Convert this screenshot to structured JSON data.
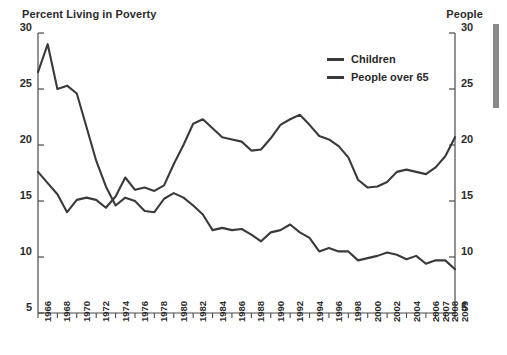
{
  "header": {
    "left_title": "Percent Living in Poverty",
    "right_title": "People"
  },
  "legend": {
    "position": "top-center",
    "items": [
      {
        "label": "Children",
        "color": "#3a3a3a"
      },
      {
        "label": "People over 65",
        "color": "#3a3a3a"
      }
    ]
  },
  "axes": {
    "y_left_ticks": [
      "30",
      "25",
      "20",
      "15",
      "10",
      "5"
    ],
    "y_right_ticks": [
      "30",
      "25",
      "20",
      "15",
      "10",
      "5"
    ],
    "x_ticks": [
      "1966",
      "1968",
      "1970",
      "1972",
      "1974",
      "1976",
      "1978",
      "1980",
      "1982",
      "1984",
      "1986",
      "1988",
      "1990",
      "1992",
      "1994",
      "1996",
      "1998",
      "2000",
      "2002",
      "2004",
      "2006",
      "2007",
      "2008",
      "2009"
    ]
  },
  "chart_data": {
    "type": "line",
    "title": "Percent Living in Poverty",
    "ylabel": "Percent Living in Poverty",
    "ylabel_right": "People",
    "xlabel": "",
    "ylim": [
      5,
      30
    ],
    "grid": false,
    "legend_position": "top-center",
    "x": [
      1966,
      1967,
      1968,
      1969,
      1970,
      1971,
      1972,
      1973,
      1974,
      1975,
      1976,
      1977,
      1978,
      1979,
      1980,
      1981,
      1982,
      1983,
      1984,
      1985,
      1986,
      1987,
      1988,
      1989,
      1990,
      1991,
      1992,
      1993,
      1994,
      1995,
      1996,
      1997,
      1998,
      1999,
      2000,
      2001,
      2002,
      2003,
      2004,
      2005,
      2006,
      2007,
      2008,
      2009
    ],
    "series": [
      {
        "name": "Children",
        "color": "#3a3a3a",
        "values": [
          17.6,
          16.6,
          15.6,
          14.0,
          15.1,
          15.3,
          15.1,
          14.4,
          15.4,
          17.1,
          16.0,
          16.2,
          15.9,
          16.4,
          18.3,
          20.0,
          21.9,
          22.3,
          21.5,
          20.7,
          20.5,
          20.3,
          19.5,
          19.6,
          20.6,
          21.8,
          22.3,
          22.7,
          21.8,
          20.8,
          20.5,
          19.9,
          18.9,
          16.9,
          16.2,
          16.3,
          16.7,
          17.6,
          17.8,
          17.6,
          17.4,
          18.0,
          19.0,
          20.7
        ]
      },
      {
        "name": "People over 65",
        "color": "#3a3a3a",
        "values": [
          26.5,
          29.0,
          25.0,
          25.3,
          24.6,
          21.6,
          18.6,
          16.3,
          14.6,
          15.3,
          15.0,
          14.1,
          14.0,
          15.2,
          15.7,
          15.3,
          14.6,
          13.8,
          12.4,
          12.6,
          12.4,
          12.5,
          12.0,
          11.4,
          12.2,
          12.4,
          12.9,
          12.2,
          11.7,
          10.5,
          10.8,
          10.5,
          10.5,
          9.7,
          9.9,
          10.1,
          10.4,
          10.2,
          9.8,
          10.1,
          9.4,
          9.7,
          9.7,
          8.9
        ]
      }
    ]
  }
}
